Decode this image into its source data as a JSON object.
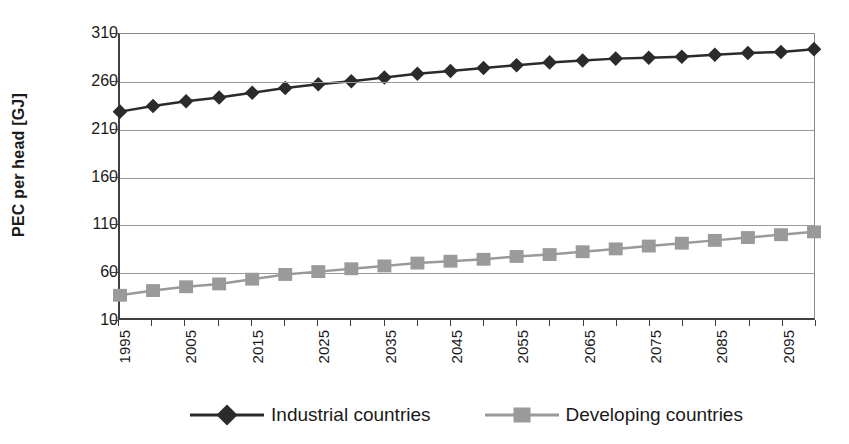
{
  "chart_data": {
    "type": "line",
    "title": "",
    "xlabel": "",
    "ylabel": "PEC per head [GJ]",
    "xlim": [
      1995,
      2100
    ],
    "ylim": [
      10,
      310
    ],
    "grid": true,
    "legend_position": "bottom",
    "yticks": [
      310,
      260,
      210,
      160,
      110,
      60,
      10
    ],
    "xticks": [
      1995,
      2000,
      2005,
      2010,
      2015,
      2020,
      2025,
      2030,
      2035,
      2040,
      2045,
      2050,
      2055,
      2060,
      2065,
      2070,
      2075,
      2080,
      2085,
      2090,
      2095,
      2100
    ],
    "xtick_labels": [
      "1995",
      "2005",
      "2015",
      "2025",
      "2035",
      "2045",
      "2055",
      "2065",
      "2075",
      "2085",
      "2095"
    ],
    "x": [
      1995,
      2000,
      2005,
      2010,
      2015,
      2020,
      2025,
      2030,
      2035,
      2040,
      2045,
      2050,
      2055,
      2060,
      2065,
      2070,
      2075,
      2080,
      2085,
      2090,
      2095,
      2100
    ],
    "series": [
      {
        "name": "Industrial countries",
        "marker": "diamond",
        "color": "#2b2b2b",
        "values": [
          228,
          234,
          239,
          243,
          248,
          253,
          257,
          260,
          264,
          268,
          271,
          274,
          277,
          280,
          282,
          284,
          285,
          286,
          288,
          290,
          291,
          294
        ]
      },
      {
        "name": "Developing countries",
        "marker": "square",
        "color": "#9a9a9a",
        "values": [
          34,
          39,
          43,
          46,
          51,
          56,
          59,
          62,
          65,
          68,
          70,
          72,
          75,
          77,
          80,
          83,
          86,
          89,
          92,
          95,
          98,
          101
        ]
      }
    ]
  },
  "legend": {
    "items": [
      {
        "label": "Industrial countries",
        "marker": "diamond",
        "color": "#2b2b2b",
        "line_color": "#2b2b2b"
      },
      {
        "label": "Developing countries",
        "marker": "square",
        "color": "#9a9a9a",
        "line_color": "#9a9a9a"
      }
    ]
  },
  "colors": {
    "axis": "#404040",
    "grid": "#9a9a9a",
    "background": "#ffffff",
    "industrial": "#2b2b2b",
    "developing": "#9a9a9a"
  }
}
